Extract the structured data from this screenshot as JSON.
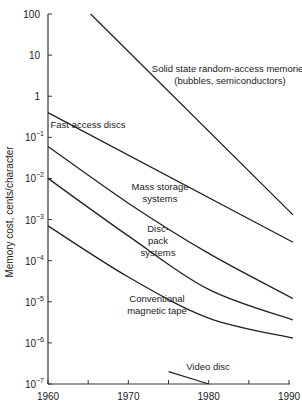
{
  "chart_data": {
    "type": "line",
    "title": "",
    "xlabel": "",
    "ylabel": "Memory cost, cents/character",
    "yscale": "log",
    "xlim": [
      1960,
      1990
    ],
    "ylim": [
      1e-07,
      100
    ],
    "grid": false,
    "x_ticks": [
      1960,
      1965,
      1970,
      1975,
      1980,
      1985,
      1990
    ],
    "x_tick_labels": [
      "1960",
      "1970",
      "1980",
      "1990"
    ],
    "y_tick_labels": [
      {
        "value": 100,
        "base": "100",
        "exp": ""
      },
      {
        "value": 10,
        "base": "10",
        "exp": ""
      },
      {
        "value": 1,
        "base": "1",
        "exp": ""
      },
      {
        "value": 0.1,
        "base": "10",
        "exp": "−1"
      },
      {
        "value": 0.01,
        "base": "10",
        "exp": "−2"
      },
      {
        "value": 0.001,
        "base": "10",
        "exp": "−3"
      },
      {
        "value": 0.0001,
        "base": "10",
        "exp": "−4"
      },
      {
        "value": 1e-05,
        "base": "10",
        "exp": "−5"
      },
      {
        "value": 1e-06,
        "base": "10",
        "exp": "−6"
      },
      {
        "value": 1e-07,
        "base": "10",
        "exp": "−7"
      }
    ],
    "series": [
      {
        "name": "Solid state random-access memories (bubbles, semiconductors)",
        "label_lines": [
          "Solid state random-access memories",
          "(bubbles, semiconductors)"
        ],
        "label_pos": [
          230,
          72
        ],
        "x": [
          1965.3,
          1990.5
        ],
        "y": [
          100,
          0.0013
        ]
      },
      {
        "name": "Fast access discs",
        "label_lines": [
          "Fast access discs"
        ],
        "label_pos": [
          88,
          128
        ],
        "x": [
          1960,
          1990.5
        ],
        "y": [
          0.4,
          0.00028
        ]
      },
      {
        "name": "Mass storage systems",
        "label_lines": [
          "Mass storage",
          "systems"
        ],
        "label_pos": [
          160,
          190
        ],
        "x": [
          1960,
          1970,
          1980,
          1990.5
        ],
        "y": [
          0.06,
          0.0025,
          0.00015,
          1.2e-05
        ]
      },
      {
        "name": "Disc-pack systems",
        "label_lines": [
          "Disc-",
          "pack",
          "systems"
        ],
        "label_pos": [
          158,
          232
        ],
        "x": [
          1960,
          1970,
          1980,
          1990.5
        ],
        "y": [
          0.01,
          0.0004,
          2e-05,
          3.6e-06
        ]
      },
      {
        "name": "Conventional magnetic tape",
        "label_lines": [
          "Conventional",
          "magnetic tape"
        ],
        "label_pos": [
          157,
          302
        ],
        "x": [
          1960,
          1970,
          1980,
          1990.5
        ],
        "y": [
          0.0007,
          4e-05,
          4e-06,
          1.3e-06
        ]
      },
      {
        "name": "Video disc",
        "label_lines": [
          "Video disc"
        ],
        "label_pos": [
          208,
          370
        ],
        "x": [
          1975,
          1980
        ],
        "y": [
          2e-07,
          1e-07
        ]
      }
    ]
  }
}
